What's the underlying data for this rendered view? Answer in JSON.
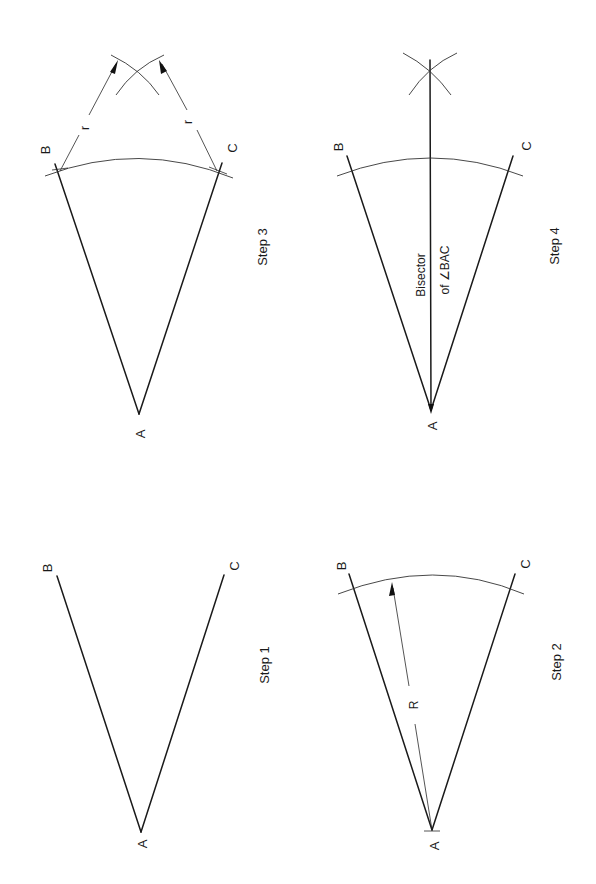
{
  "diagram": {
    "orientation": "rotated 90° counter-clockwise (page reads sideways)",
    "steps": [
      {
        "id": "step1",
        "label": "Step 1",
        "points": {
          "A": "A",
          "B": "B",
          "C": "C"
        },
        "description": "Given angle BAC"
      },
      {
        "id": "step2",
        "label": "Step 2",
        "points": {
          "A": "A",
          "B": "B",
          "C": "C"
        },
        "dimension_label": "R",
        "description": "Arc of radius R centered at A cuts AB and AC"
      },
      {
        "id": "step3",
        "label": "Step 3",
        "points": {
          "A": "A",
          "B": "B",
          "C": "C"
        },
        "dimension_label_b": "r",
        "dimension_label_c": "r",
        "description": "Arcs of radius r from B and C intersect"
      },
      {
        "id": "step4",
        "label": "Step 4",
        "points": {
          "A": "A",
          "B": "B",
          "C": "C"
        },
        "annotation_line1": "Bisector",
        "annotation_line2": "of ∠BAC",
        "description": "Line from A through arc intersection bisects angle BAC"
      }
    ],
    "colors": {
      "stroke": "#1a1a1a",
      "background": "#ffffff"
    }
  }
}
